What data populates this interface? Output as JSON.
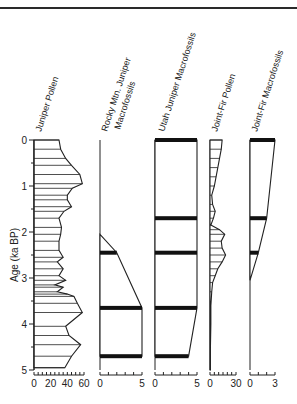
{
  "chart_data": {
    "type": "area",
    "title": "",
    "ylabel": "Age (ka BP)",
    "ylim": [
      0,
      5
    ],
    "y_ticks": [
      0,
      1,
      2,
      3,
      4,
      5
    ],
    "y_minor_ticks": [
      0.5,
      1.5,
      2.5,
      3.5,
      4.5
    ],
    "panels": [
      {
        "name": "Juniper Pollen",
        "xlim": [
          0,
          60
        ],
        "x_ticks": [
          0,
          20,
          40,
          60
        ],
        "style": "pollen-curve",
        "ages": [
          0,
          0.2,
          0.4,
          0.55,
          0.75,
          0.95,
          1.05,
          1.2,
          1.3,
          1.45,
          1.55,
          1.7,
          1.9,
          2.05,
          2.2,
          2.4,
          2.55,
          2.65,
          2.8,
          2.95,
          3.05,
          3.15,
          3.2,
          3.3,
          3.35,
          3.4,
          3.55,
          3.75,
          4.05,
          4.25,
          4.45,
          4.7,
          4.95
        ],
        "values": [
          30,
          32,
          38,
          45,
          55,
          58,
          46,
          40,
          40,
          45,
          36,
          30,
          33,
          32,
          30,
          30,
          35,
          28,
          35,
          30,
          38,
          25,
          35,
          28,
          40,
          48,
          52,
          58,
          38,
          42,
          56,
          45,
          37
        ]
      },
      {
        "name": "Rocky Mtn. Juniper Macrofossils",
        "xlim": [
          0,
          5
        ],
        "x_ticks": [
          0,
          5
        ],
        "style": "macrofossil",
        "sample_ages": [
          2.45,
          3.65,
          4.7
        ],
        "values": [
          2,
          5,
          5
        ],
        "outline": [
          [
            0,
            2.05
          ],
          [
            2,
            2.45
          ],
          [
            5,
            3.65
          ],
          [
            5,
            4.7
          ]
        ]
      },
      {
        "name": "Utah Juniper Macrofossils",
        "xlim": [
          0,
          5
        ],
        "x_ticks": [
          0,
          5
        ],
        "style": "macrofossil",
        "sample_ages": [
          0,
          1.7,
          2.45,
          3.65,
          4.7
        ],
        "values": [
          5,
          5,
          5,
          5,
          4
        ],
        "outline": [
          [
            5,
            0
          ],
          [
            5,
            1.7
          ],
          [
            5,
            2.45
          ],
          [
            5,
            3.65
          ],
          [
            4,
            4.7
          ]
        ]
      },
      {
        "name": "Joint-Fir Pollen",
        "xlim": [
          0,
          30
        ],
        "x_ticks": [
          0,
          30
        ],
        "style": "pollen-curve",
        "ages": [
          0,
          0.2,
          0.4,
          0.6,
          0.8,
          1.0,
          1.2,
          1.4,
          1.55,
          1.7,
          1.85,
          1.95,
          2.05,
          2.2,
          2.35,
          2.5,
          2.65,
          2.8,
          2.95,
          3.1,
          3.3,
          3.6,
          4.0,
          4.5,
          5.0
        ],
        "values": [
          14,
          13,
          11,
          9,
          7,
          5,
          2,
          3,
          6,
          4,
          1,
          11,
          17,
          13,
          14,
          18,
          14,
          9,
          6,
          3,
          2,
          1,
          1,
          0.5,
          0.5
        ]
      },
      {
        "name": "Joint-Fir Macrofossils",
        "xlim": [
          0,
          3
        ],
        "x_ticks": [
          0,
          3
        ],
        "style": "macrofossil",
        "sample_ages": [
          0,
          1.7,
          2.45
        ],
        "values": [
          3,
          2,
          1
        ],
        "outline": [
          [
            3,
            0
          ],
          [
            2,
            1.7
          ],
          [
            1,
            2.45
          ],
          [
            0,
            3.05
          ]
        ]
      }
    ]
  },
  "labels": {
    "y_axis": "Age (ka BP)",
    "panel_titles": [
      "Juniper Pollen",
      "Rocky Mtn. Juniper",
      "Macrofossils",
      "Utah Juniper Macrofossils",
      "Joint-Fir Pollen",
      "Joint-Fir Macrofossils"
    ],
    "y_tick_labels": [
      "0",
      "1",
      "2",
      "3",
      "4",
      "5"
    ],
    "x_tick_labels": {
      "juniper_pollen": [
        "0",
        "20",
        "40",
        "60"
      ],
      "rocky": [
        "0",
        "5"
      ],
      "utah": [
        "0",
        "5"
      ],
      "jf_pollen": [
        "0",
        "30"
      ],
      "jf_macro": [
        "0",
        "3"
      ]
    }
  }
}
